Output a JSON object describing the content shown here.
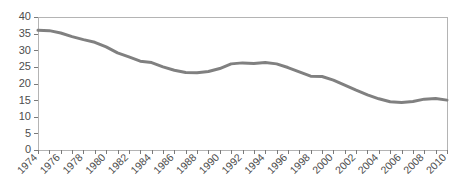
{
  "chart_data": {
    "type": "line",
    "title": "",
    "subtitle": "",
    "xlabel": "",
    "ylabel": "",
    "legend": [],
    "legend_position": "none",
    "grid": false,
    "line_color": "#808080",
    "line_width": 3,
    "frame_color": "#b4b4b4",
    "tick_color": "#7a7a7a",
    "label_color": "#4d4d4d",
    "xlim": [
      1974,
      2010
    ],
    "ylim": [
      0,
      40
    ],
    "y_ticks": [
      0,
      5,
      10,
      15,
      20,
      25,
      30,
      35,
      40
    ],
    "y_tick_labels": [
      "0",
      "5",
      "10",
      "15",
      "20",
      "25",
      "30",
      "35",
      "40"
    ],
    "x_tick_years": [
      1974,
      1975,
      1976,
      1977,
      1978,
      1979,
      1980,
      1981,
      1982,
      1983,
      1984,
      1985,
      1986,
      1987,
      1988,
      1989,
      1990,
      1991,
      1992,
      1993,
      1994,
      1995,
      1996,
      1997,
      1998,
      1999,
      2000,
      2001,
      2002,
      2003,
      2004,
      2005,
      2006,
      2007,
      2008,
      2009,
      2010
    ],
    "x_tick_labels": [
      "1974",
      "1976",
      "1978",
      "1980",
      "1982",
      "1984",
      "1986",
      "1988",
      "1990",
      "1992",
      "1994",
      "1996",
      "1998",
      "2000",
      "2002",
      "2004",
      "2006",
      "2008",
      "2010"
    ],
    "x_label_years": [
      1974,
      1976,
      1978,
      1980,
      1982,
      1984,
      1986,
      1988,
      1990,
      1992,
      1994,
      1996,
      1998,
      2000,
      2002,
      2004,
      2006,
      2008,
      2010
    ],
    "x_label_rotation": -45,
    "x": [
      1974,
      1975,
      1976,
      1977,
      1978,
      1979,
      1980,
      1981,
      1982,
      1983,
      1984,
      1985,
      1986,
      1987,
      1988,
      1989,
      1990,
      1991,
      1992,
      1993,
      1994,
      1995,
      1996,
      1997,
      1998,
      1999,
      2000,
      2001,
      2002,
      2003,
      2004,
      2005,
      2006,
      2007,
      2008,
      2009,
      2010
    ],
    "values": [
      36.0,
      35.9,
      35.2,
      34.1,
      33.2,
      32.4,
      31.0,
      29.2,
      28.0,
      26.7,
      26.3,
      25.0,
      24.0,
      23.3,
      23.2,
      23.6,
      24.5,
      25.9,
      26.2,
      26.0,
      26.3,
      25.9,
      24.8,
      23.5,
      22.2,
      22.1,
      21.0,
      19.5,
      18.0,
      16.6,
      15.4,
      14.5,
      14.3,
      14.6,
      15.3,
      15.5,
      15.0
    ]
  }
}
